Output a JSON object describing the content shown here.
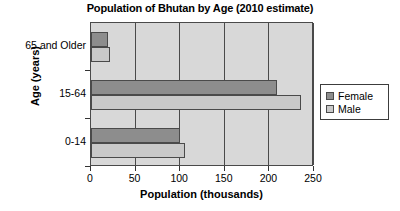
{
  "chart_data": {
    "type": "bar",
    "orientation": "horizontal",
    "title": "Population of Bhutan by Age (2010 estimate)",
    "xlabel": "Population (thousands)",
    "ylabel": "Age (years)",
    "categories": [
      "0-14",
      "15-64",
      "65 and Older"
    ],
    "series": [
      {
        "name": "Female",
        "color": "#8d8d8d",
        "values": [
          100,
          209,
          19
        ]
      },
      {
        "name": "Male",
        "color": "#c9c9c9",
        "values": [
          105,
          235,
          21
        ]
      }
    ],
    "xlim": [
      0,
      250
    ],
    "xticks": [
      0,
      50,
      100,
      150,
      200,
      250
    ],
    "xtick_labels": [
      "0",
      "50",
      "100",
      "150",
      "200",
      "250"
    ],
    "grid": true,
    "grid_axis": "x",
    "legend_position": "right",
    "plot_background": "#d8d8d8",
    "axis_color": "#4a4a4a"
  },
  "legend": {
    "items": [
      {
        "label": "Female"
      },
      {
        "label": "Male"
      }
    ]
  }
}
